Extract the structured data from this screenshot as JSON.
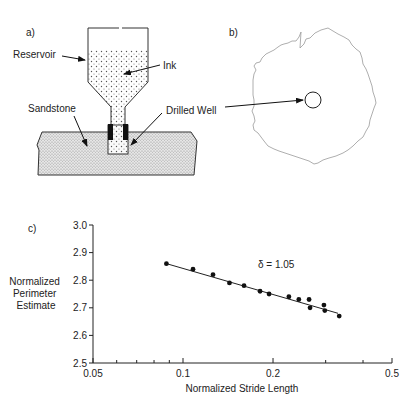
{
  "panel_a": {
    "label": "a)",
    "reservoir_label": "Reservoir",
    "ink_label": "Ink",
    "sandstone_label": "Sandstone",
    "well_label": "Drilled Well"
  },
  "panel_b": {
    "label": "b)"
  },
  "panel_c": {
    "label": "c)",
    "annotation": "δ = 1.05"
  },
  "chart_data": {
    "type": "scatter",
    "title": "",
    "xlabel": "Normalized Stride Length",
    "ylabel": "Normalized Perimeter Estimate",
    "ylabel_lines": [
      "Normalized",
      "Perimeter",
      "Estimate"
    ],
    "xscale": "log",
    "xlim": [
      0.05,
      0.5
    ],
    "ylim": [
      2.5,
      3.0
    ],
    "xticks": [
      "0.05",
      "0.1",
      "0.2",
      "0.5"
    ],
    "yticks": [
      "2.5",
      "2.6",
      "2.7",
      "2.8",
      "2.9",
      "3.0"
    ],
    "grid": false,
    "legend": null,
    "annotations": [
      "δ = 1.05"
    ],
    "series": [
      {
        "name": "measured",
        "x": [
          0.088,
          0.108,
          0.126,
          0.143,
          0.16,
          0.181,
          0.194,
          0.226,
          0.244,
          0.264,
          0.266,
          0.296,
          0.298,
          0.333
        ],
        "y": [
          2.86,
          2.84,
          2.82,
          2.79,
          2.78,
          2.76,
          2.75,
          2.74,
          2.73,
          2.73,
          2.7,
          2.71,
          2.69,
          2.67
        ]
      },
      {
        "name": "fit",
        "type": "line",
        "x": [
          0.088,
          0.33
        ],
        "y": [
          2.86,
          2.68
        ]
      }
    ]
  }
}
